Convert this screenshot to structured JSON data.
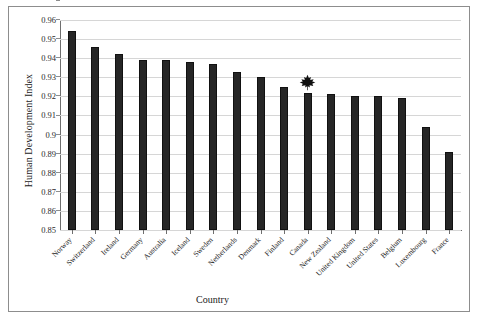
{
  "chart_data": {
    "type": "bar",
    "title": "",
    "xlabel": "Country",
    "ylabel": "Human Development Index",
    "ylim": [
      0.85,
      0.96
    ],
    "ytick_step": 0.01,
    "grid": true,
    "legend": "none",
    "bar_color": "#262626",
    "categories": [
      "Norway",
      "Switzerland",
      "Ireland",
      "Germany",
      "Australia",
      "Iceland",
      "Sweden",
      "Netherlands",
      "Denmark",
      "Finland",
      "Canada",
      "New Zealand",
      "United Kingdom",
      "United States",
      "Belgium",
      "Luxembourg",
      "France"
    ],
    "values": [
      0.954,
      0.946,
      0.942,
      0.939,
      0.939,
      0.938,
      0.937,
      0.933,
      0.93,
      0.925,
      0.922,
      0.921,
      0.92,
      0.92,
      0.919,
      0.904,
      0.891
    ],
    "ytick_labels": [
      "0.96",
      "0.95",
      "0.94",
      "0.93",
      "0.92",
      "0.91",
      "0.9",
      "0.89",
      "0.88",
      "0.87",
      "0.86",
      "0.85"
    ],
    "annotations": [
      {
        "name": "maple-leaf-marker",
        "category": "Canada",
        "icon": "maple-leaf-icon",
        "color": "#111111"
      }
    ]
  }
}
